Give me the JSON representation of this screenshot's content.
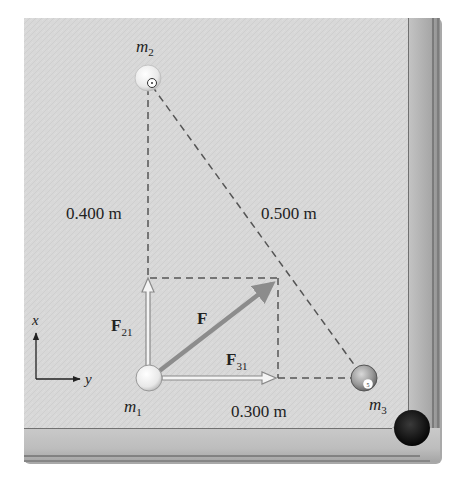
{
  "figure": {
    "type": "physics-free-body-diagram",
    "scene": "billiard table corner"
  },
  "masses": {
    "m1": {
      "label": "m",
      "subscript": "1"
    },
    "m2": {
      "label": "m",
      "subscript": "2"
    },
    "m3": {
      "label": "m",
      "subscript": "3"
    }
  },
  "distances": {
    "m1_m2": "0.400 m",
    "m2_m3": "0.500 m",
    "m1_m3": "0.300 m"
  },
  "forces": {
    "F21": {
      "label": "F",
      "subscript": "21"
    },
    "F31": {
      "label": "F",
      "subscript": "31"
    },
    "F": {
      "label": "F"
    }
  },
  "axes": {
    "x_label": "x",
    "y_label": "y"
  },
  "colors": {
    "felt": "#d9d9d9",
    "rail": "#b8b8b8",
    "rail_dark": "#6b6b6b",
    "pocket": "#111111",
    "force_resultant": "#8c8c8c",
    "dashed": "#555555"
  }
}
